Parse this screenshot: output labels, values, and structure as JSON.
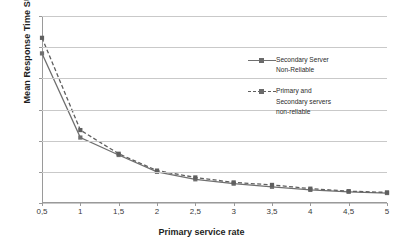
{
  "chart_data": {
    "type": "line",
    "title": "",
    "xlabel": "Primary service rate",
    "ylabel": "Mean Response Time SU",
    "x": [
      0.5,
      1,
      1.5,
      2,
      2.5,
      3,
      3.5,
      4,
      4.5,
      5
    ],
    "xtick_labels": [
      "0,5",
      "1",
      "1,5",
      "2",
      "2,5",
      "3",
      "3,5",
      "4",
      "4,5",
      "5"
    ],
    "ytick_labels": [
      "0",
      "50",
      "100",
      "150",
      "200",
      "250",
      "300"
    ],
    "yticks": [
      0,
      50,
      100,
      150,
      200,
      250,
      300
    ],
    "ylim": [
      0,
      300
    ],
    "xlim": [
      0.5,
      5
    ],
    "grid": "horizontal",
    "legend_position": "right",
    "series": [
      {
        "name": "Secondary Server Non-Reliable",
        "line_style": "solid",
        "marker": "square",
        "color": "#6f6f6f",
        "values": [
          240,
          105,
          77,
          50,
          38,
          31,
          26,
          21,
          18,
          16
        ]
      },
      {
        "name": "Primary and Secondary servers non-reliable",
        "line_style": "dashed",
        "marker": "square",
        "color": "#5f5f5f",
        "values": [
          265,
          117,
          79,
          52,
          41,
          33,
          29,
          23,
          19,
          17
        ]
      }
    ]
  },
  "axes": {
    "x_title": "Primary service rate",
    "y_title": "Mean Response Time SU"
  },
  "legend": {
    "entries": [
      {
        "label_line1": "Secondary Server",
        "label_line2": "Non-Reliable",
        "label_line3": "",
        "style": "solid"
      },
      {
        "label_line1": "Primary and",
        "label_line2": "Secondary servers",
        "label_line3": "non-reliable",
        "style": "dashed"
      }
    ]
  },
  "colors": {
    "series_solid": "#6f6f6f",
    "series_dashed": "#5f5f5f",
    "gridline": "#c9c9c9",
    "axis": "#9a9a9a",
    "text": "#2b2b2b",
    "background": "#ffffff"
  }
}
